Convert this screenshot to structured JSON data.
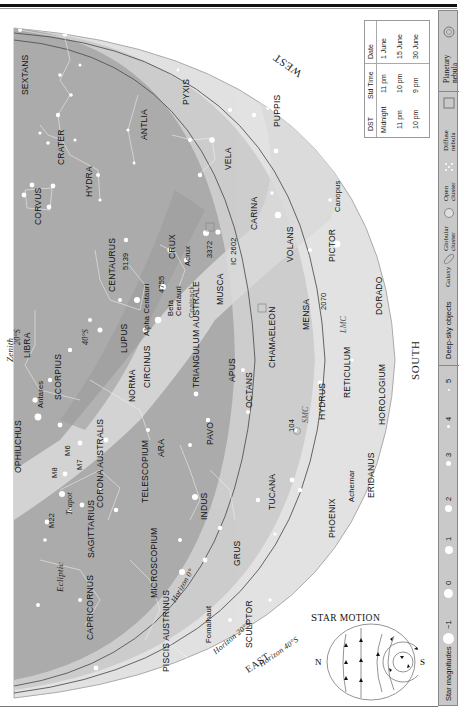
{
  "page": {
    "directions": {
      "west": "WEST",
      "south": "SOUTH",
      "east": "EAST"
    }
  },
  "colors": {
    "sky_outer": "#e4e4e4",
    "sky_mid": "#cfcfcf",
    "sky_inner": "#a9a9a9",
    "milky_way": "#d8d8d8",
    "horizon_line": "#555555",
    "star": "#ffffff",
    "legend_bg": "#c9c9c9"
  },
  "horizons": [
    {
      "label": "Horizon 0°"
    },
    {
      "label": "Horizon 20°S"
    },
    {
      "label": "Horizon 40°S"
    }
  ],
  "markers": {
    "zenith": "Zenith",
    "lat_20s": "20°S",
    "lat_40s": "40°S",
    "ecliptic": "Ecliptic"
  },
  "constellations": [
    "SEXTANS",
    "PYXIS",
    "ANTLIA",
    "CRATER",
    "HYDRA",
    "CORVUS",
    "PUPPIS",
    "VELA",
    "CENTAURUS",
    "CRUX",
    "CARINA",
    "MUSCA",
    "VOLANS",
    "PICTOR",
    "LIBRA",
    "LUPUS",
    "CIRCINUS",
    "TRIANGULUM AUSTRALE",
    "CHAMAELEON",
    "MENSA",
    "DORADO",
    "SCORPIUS",
    "NORMA",
    "APUS",
    "OCTANS",
    "RETICULUM",
    "HYDRUS",
    "HOROLOGIUM",
    "OPHIUCHUS",
    "ARA",
    "PAVO",
    "CORONA AUSTRALIS",
    "TELESCOPIUM",
    "SAGITTARIUS",
    "INDUS",
    "TUCANA",
    "ERIDANUS",
    "PHOENIX",
    "CAPRICORNUS",
    "MICROSCOPIUM",
    "GRUS",
    "PISCIS AUSTRINUS",
    "SCULPTOR"
  ],
  "stars": [
    "Canopus",
    "Acrux",
    "Beta Centauri",
    "Alpha Centauri",
    "Antares",
    "Achernar",
    "Fomalhaut"
  ],
  "deep_sky": [
    "5139",
    "4755",
    "3372",
    "IC 2602",
    "2070",
    "104",
    "M6",
    "M7",
    "M8",
    "M22"
  ],
  "named_features": [
    "Coalsack",
    "LMC",
    "SMC",
    "Teapot"
  ],
  "time_table": {
    "headers": [
      "Date",
      "Std Time",
      "DST"
    ],
    "rows": [
      [
        "1 June",
        "11 pm",
        "Midnight"
      ],
      [
        "15 June",
        "10 pm",
        "11 pm"
      ],
      [
        "30 June",
        "9 pm",
        "10 pm"
      ]
    ]
  },
  "legend": {
    "deep_sky_title": "Deep-sky objects",
    "deep_sky_items": [
      "Galaxy",
      "Globular cluster",
      "Open cluster",
      "Diffuse nebula",
      "Planetary nebula"
    ],
    "magnitudes_title": "Star magnitudes",
    "magnitudes": [
      "−1",
      "0",
      "1",
      "2",
      "3",
      "4",
      "5"
    ]
  },
  "star_motion": {
    "title": "Star motion",
    "north": "N",
    "south": "S"
  }
}
